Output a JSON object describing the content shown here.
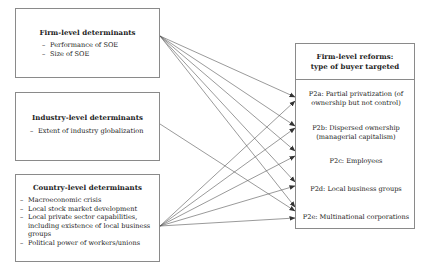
{
  "left_boxes": [
    {
      "title": "Firm-level determinants",
      "items": [
        "Performance of SOE",
        "Size of SOE"
      ]
    },
    {
      "title": "Industry-level determinants",
      "items": [
        "Extent of industry globalization"
      ]
    },
    {
      "title": "Country-level determinants",
      "items": [
        "Macroeconomic crisis",
        "Local stock market development",
        "Local private sector capabilities, including existence of local business groups",
        "Political power of workers/unions"
      ]
    }
  ],
  "right_box": {
    "title_line1": "Firm-level reforms:",
    "title_line2": "type of buyer targeted",
    "options": [
      {
        "line1": "P2a:  Partial privatization (of",
        "line2": "ownership but not control)"
      },
      {
        "line1": "P2b:  Dispersed ownership",
        "line2": "(managerial capitalism)"
      },
      {
        "line1": "P2c:  Employees",
        "line2": ""
      },
      {
        "line1": "P2d:  Local business groups",
        "line2": ""
      },
      {
        "line1": "P2e:  Multinational corporations",
        "line2": ""
      }
    ]
  },
  "arrows": {
    "color": "#555555",
    "from_firm": [
      "P2a",
      "P2b",
      "P2c",
      "P2d",
      "P2e"
    ],
    "from_industry": [
      "P2e"
    ],
    "from_country": [
      "P2a",
      "P2b",
      "P2c",
      "P2d",
      "P2e"
    ]
  }
}
